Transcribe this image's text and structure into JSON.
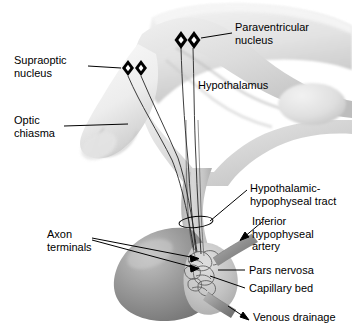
{
  "figure": {
    "background_color": "#ffffff",
    "width": 352,
    "height": 333,
    "line_color": "#000000",
    "ink_color": "#000000"
  },
  "labels": {
    "paraventricular_nucleus": "Paraventricular\nnucleus",
    "supraoptic_nucleus": "Supraoptic\nnucleus",
    "hypothalamus": "Hypothalamus",
    "optic_chiasma": "Optic\nchiasma",
    "hypothalamic_hypophyseal_tract": "Hypothalamic-\nhypophyseal tract",
    "inferior_hypophyseal_artery": "Inferior\nhypophyseal\nartery",
    "axon_terminals": "Axon\nterminals",
    "pars_nervosa": "Pars nervosa",
    "capillary_bed": "Capillary bed",
    "venous_drainage": "Venous drainage"
  },
  "structures": {
    "brain_tissue_fill": "#e9e9e9",
    "brain_tissue_shadow": "#b8b8b8",
    "hypothalamus_fill": "#dcdcdc",
    "optic_chiasma_fill": "#f0f0f0",
    "stalk_fill": "#cfcfcf",
    "pars_nervosa_fill": "#c9c9c9",
    "anterior_pituitary_fill": "#8f8f8f",
    "neuron_marker_fill": "#000000",
    "neuron_marker_center": "#ffffff",
    "capillary_outline": "#555555",
    "artery_fill": "#9a9a9a",
    "vein_fill": "#9a9a9a"
  },
  "markers": {
    "paraventricular_neuron_count": 2,
    "supraoptic_neuron_count": 2,
    "arrow_count": 4
  }
}
